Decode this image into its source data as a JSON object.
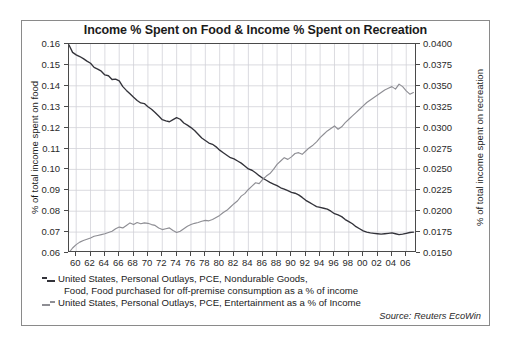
{
  "chart_data": {
    "type": "line",
    "title": "Income % Spent on Food & Income % Spent on Recreation",
    "xlabel": "",
    "ylabel": "% of total income spent on food",
    "y2label": "% of total income spent on recreation",
    "grid": true,
    "legend_position": "below-plot-left",
    "source": "Source: Reuters EcoWin",
    "xlim": [
      1959,
      2007.5
    ],
    "ylim": [
      0.06,
      0.16
    ],
    "y2lim": [
      0.015,
      0.04
    ],
    "xticks": [
      "60",
      "62",
      "64",
      "66",
      "68",
      "70",
      "72",
      "74",
      "76",
      "78",
      "80",
      "82",
      "84",
      "86",
      "88",
      "90",
      "92",
      "94",
      "96",
      "98",
      "00",
      "02",
      "04",
      "06"
    ],
    "xtick_values": [
      1960,
      1962,
      1964,
      1966,
      1968,
      1970,
      1972,
      1974,
      1976,
      1978,
      1980,
      1982,
      1984,
      1986,
      1988,
      1990,
      1992,
      1994,
      1996,
      1998,
      2000,
      2002,
      2004,
      2006
    ],
    "yticks": [
      "0.06",
      "0.07",
      "0.08",
      "0.09",
      "0.10",
      "0.11",
      "0.12",
      "0.13",
      "0.14",
      "0.15",
      "0.16"
    ],
    "ytick_values": [
      0.06,
      0.07,
      0.08,
      0.09,
      0.1,
      0.11,
      0.12,
      0.13,
      0.14,
      0.15,
      0.16
    ],
    "y2ticks": [
      "0.0150",
      "0.0175",
      "0.0200",
      "0.0225",
      "0.0250",
      "0.0275",
      "0.0300",
      "0.0325",
      "0.0350",
      "0.0375",
      "0.0400"
    ],
    "y2tick_values": [
      0.015,
      0.0175,
      0.02,
      0.0225,
      0.025,
      0.0275,
      0.03,
      0.0325,
      0.035,
      0.0375,
      0.04
    ],
    "series": [
      {
        "name": "food",
        "axis": "left",
        "color": "#33333a",
        "legend": "United States, Personal Outlays, PCE, Nondurable Goods, Food, Food purchased for off-premise consumption as a % of income",
        "legend_line1": "United States, Personal Outlays, PCE, Nondurable Goods,",
        "legend_line2": "Food, Food purchased for off-premise consumption as a % of income",
        "x": [
          1959.0,
          1959.5,
          1960.0,
          1960.5,
          1961.0,
          1961.5,
          1962.0,
          1962.5,
          1963.0,
          1963.5,
          1964.0,
          1964.5,
          1965.0,
          1965.5,
          1966.0,
          1966.5,
          1967.0,
          1967.5,
          1968.0,
          1968.5,
          1969.0,
          1969.5,
          1970.0,
          1970.5,
          1971.0,
          1971.5,
          1972.0,
          1972.5,
          1973.0,
          1973.5,
          1974.0,
          1974.5,
          1975.0,
          1975.5,
          1976.0,
          1976.5,
          1977.0,
          1977.5,
          1978.0,
          1978.5,
          1979.0,
          1979.5,
          1980.0,
          1980.5,
          1981.0,
          1981.5,
          1982.0,
          1982.5,
          1983.0,
          1983.5,
          1984.0,
          1984.5,
          1985.0,
          1985.5,
          1986.0,
          1986.5,
          1987.0,
          1987.5,
          1988.0,
          1988.5,
          1989.0,
          1989.5,
          1990.0,
          1990.5,
          1991.0,
          1991.5,
          1992.0,
          1992.5,
          1993.0,
          1993.5,
          1994.0,
          1994.5,
          1995.0,
          1995.5,
          1996.0,
          1996.5,
          1997.0,
          1997.5,
          1998.0,
          1998.5,
          1999.0,
          1999.5,
          2000.0,
          2000.5,
          2001.0,
          2001.5,
          2002.0,
          2002.5,
          2003.0,
          2003.5,
          2004.0,
          2004.5,
          2005.0,
          2005.5,
          2006.0,
          2006.5,
          2007.0
        ],
        "y": [
          0.1595,
          0.156,
          0.1548,
          0.154,
          0.153,
          0.1518,
          0.1508,
          0.1488,
          0.148,
          0.147,
          0.1452,
          0.1448,
          0.143,
          0.1432,
          0.1424,
          0.1396,
          0.1378,
          0.1362,
          0.1345,
          0.133,
          0.1318,
          0.1315,
          0.13,
          0.1288,
          0.1272,
          0.1255,
          0.1238,
          0.1232,
          0.1228,
          0.1238,
          0.1248,
          0.124,
          0.1222,
          0.1212,
          0.12,
          0.1186,
          0.1168,
          0.115,
          0.1138,
          0.1126,
          0.112,
          0.1108,
          0.1092,
          0.108,
          0.1068,
          0.1056,
          0.105,
          0.104,
          0.103,
          0.1016,
          0.1002,
          0.0996,
          0.0984,
          0.097,
          0.0958,
          0.0948,
          0.0938,
          0.093,
          0.0922,
          0.0912,
          0.0906,
          0.0898,
          0.089,
          0.0886,
          0.0878,
          0.0866,
          0.0852,
          0.0842,
          0.0832,
          0.0822,
          0.0818,
          0.0814,
          0.081,
          0.08,
          0.0788,
          0.0782,
          0.0774,
          0.076,
          0.075,
          0.074,
          0.0726,
          0.0716,
          0.0706,
          0.07,
          0.0696,
          0.0694,
          0.0692,
          0.069,
          0.0692,
          0.0694,
          0.0696,
          0.0692,
          0.0688,
          0.069,
          0.0694,
          0.0698,
          0.07
        ]
      },
      {
        "name": "recreation",
        "axis": "right",
        "color": "#8e8e94",
        "legend": "United States, Personal Outlays, PCE, Entertainment as a % of Income",
        "legend_line1": "United States, Personal Outlays, PCE, Entertainment as a % of Income",
        "x": [
          1959.0,
          1959.5,
          1960.0,
          1960.5,
          1961.0,
          1961.5,
          1962.0,
          1962.5,
          1963.0,
          1963.5,
          1964.0,
          1964.5,
          1965.0,
          1965.5,
          1966.0,
          1966.5,
          1967.0,
          1967.5,
          1968.0,
          1968.5,
          1969.0,
          1969.5,
          1970.0,
          1970.5,
          1971.0,
          1971.5,
          1972.0,
          1972.5,
          1973.0,
          1973.5,
          1974.0,
          1974.5,
          1975.0,
          1975.5,
          1976.0,
          1976.5,
          1977.0,
          1977.5,
          1978.0,
          1978.5,
          1979.0,
          1979.5,
          1980.0,
          1980.5,
          1981.0,
          1981.5,
          1982.0,
          1982.5,
          1983.0,
          1983.5,
          1984.0,
          1984.5,
          1985.0,
          1985.5,
          1986.0,
          1986.5,
          1987.0,
          1987.5,
          1988.0,
          1988.5,
          1989.0,
          1989.5,
          1990.0,
          1990.5,
          1991.0,
          1991.5,
          1992.0,
          1992.5,
          1993.0,
          1993.5,
          1994.0,
          1994.5,
          1995.0,
          1995.5,
          1996.0,
          1996.5,
          1997.0,
          1997.5,
          1998.0,
          1998.5,
          1999.0,
          1999.5,
          2000.0,
          2000.5,
          2001.0,
          2001.5,
          2002.0,
          2002.5,
          2003.0,
          2003.5,
          2004.0,
          2004.5,
          2005.0,
          2005.5,
          2006.0,
          2006.5,
          2007.0
        ],
        "y": [
          0.01505,
          0.0156,
          0.016,
          0.0163,
          0.0165,
          0.01665,
          0.0168,
          0.017,
          0.0171,
          0.0172,
          0.0173,
          0.01745,
          0.0176,
          0.0179,
          0.0181,
          0.018,
          0.0183,
          0.0186,
          0.0184,
          0.01865,
          0.0185,
          0.0186,
          0.01855,
          0.0184,
          0.0183,
          0.018,
          0.0178,
          0.0179,
          0.018,
          0.0177,
          0.01745,
          0.0176,
          0.0179,
          0.0182,
          0.0184,
          0.01855,
          0.01865,
          0.0188,
          0.0189,
          0.01885,
          0.019,
          0.01925,
          0.0195,
          0.01985,
          0.0201,
          0.0205,
          0.0209,
          0.02125,
          0.0218,
          0.0221,
          0.0226,
          0.023,
          0.0234,
          0.0233,
          0.0238,
          0.0242,
          0.0245,
          0.025,
          0.0256,
          0.026,
          0.0264,
          0.0262,
          0.0265,
          0.0269,
          0.027,
          0.0268,
          0.0272,
          0.0276,
          0.0279,
          0.0283,
          0.0288,
          0.0292,
          0.0296,
          0.0299,
          0.0302,
          0.0298,
          0.0301,
          0.0306,
          0.031,
          0.0314,
          0.0318,
          0.0322,
          0.0326,
          0.033,
          0.0333,
          0.0336,
          0.0339,
          0.0342,
          0.0345,
          0.0347,
          0.0349,
          0.0346,
          0.0352,
          0.0349,
          0.0344,
          0.034,
          0.0342
        ]
      }
    ]
  },
  "legend": {
    "items": [
      {
        "line1": "United States, Personal Outlays, PCE, Nondurable Goods,",
        "line2": "Food, Food purchased for off-premise consumption as a % of income"
      },
      {
        "line1": "United States, Personal Outlays, PCE, Entertainment as a % of Income",
        "line2": ""
      }
    ]
  },
  "source_note": "Source: Reuters EcoWin"
}
